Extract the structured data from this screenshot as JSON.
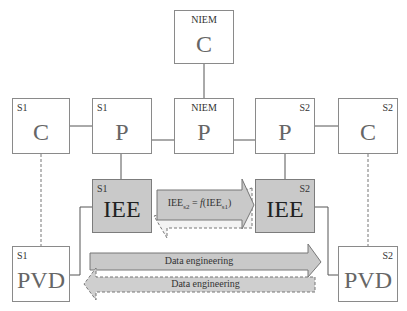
{
  "nodes": {
    "niem_c": {
      "tag": "NIEM",
      "label": "C"
    },
    "s1_c": {
      "tag": "S1",
      "label": "C"
    },
    "s1_p": {
      "tag": "S1",
      "label": "P"
    },
    "niem_p": {
      "tag": "NIEM",
      "label": "P"
    },
    "s2_p": {
      "tag": "S2",
      "label": "P"
    },
    "s2_c": {
      "tag": "S2",
      "label": "C"
    },
    "s1_iee": {
      "tag": "S1",
      "label": "IEE"
    },
    "s2_iee": {
      "tag": "S2",
      "label": "IEE"
    },
    "s1_pvd": {
      "tag": "S1",
      "label": "PVD"
    },
    "s2_pvd": {
      "tag": "S2",
      "label": "PVD"
    }
  },
  "arrows": {
    "iee_mapping": {
      "prefix": "IEE",
      "sub1": "s2",
      "mid": " = ",
      "f": "f",
      "open": "(IEE",
      "sub2": "s1",
      "close": ")"
    },
    "data_eng_forward": "Data engineering",
    "data_eng_backward": "Data engineering"
  },
  "colors": {
    "shaded": "#c9c9c9",
    "border": "#8a8a8a",
    "line": "#555555"
  }
}
